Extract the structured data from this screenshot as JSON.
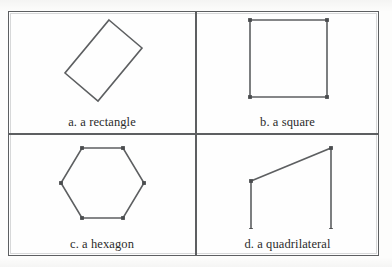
{
  "figure": {
    "stroke_color": "#5d5f61",
    "vertex_color": "#4a4c4e",
    "background_color": "#fefefe",
    "text_color": "#2b2b2b",
    "grid": {
      "rows": 2,
      "cols": 2
    }
  },
  "cells": [
    {
      "key": "a",
      "label": "a. a rectangle",
      "shape": "rectangle",
      "rotated": true,
      "vertices_shown": false,
      "points": "100,8 133,36 89,89 56,61",
      "viewbox": "0 0 186 95"
    },
    {
      "key": "b",
      "label": "b. a square",
      "shape": "square",
      "rotated": false,
      "vertices_shown": true,
      "points": "53,8 130,8 130,85 53,85",
      "viewbox": "0 0 181 95"
    },
    {
      "key": "c",
      "label": "c. a hexagon",
      "shape": "hexagon",
      "rotated": false,
      "vertices_shown": true,
      "points": "73,13 114,13 135,48 114,83 73,83 52,48",
      "viewbox": "0 0 186 94"
    },
    {
      "key": "d",
      "label": "d. a quadrilateral",
      "shape": "quadrilateral",
      "rotated": false,
      "vertices_shown": true,
      "points": "54,46 134,13 134,95 54,95",
      "viewbox": "0 0 181 94"
    }
  ]
}
